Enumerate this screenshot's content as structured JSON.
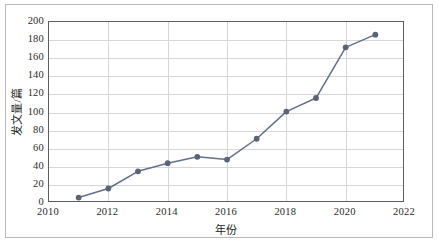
{
  "chart_data": {
    "type": "line",
    "title": "",
    "xlabel": "年份",
    "ylabel": "发文量/篇",
    "x": [
      2011,
      2012,
      2013,
      2014,
      2015,
      2016,
      2017,
      2018,
      2019,
      2020,
      2021
    ],
    "values": [
      6,
      16,
      35,
      44,
      51,
      48,
      71,
      101,
      116,
      172,
      186
    ],
    "series": [
      {
        "name": "发文量",
        "values": [
          6,
          16,
          35,
          44,
          51,
          48,
          71,
          101,
          116,
          172,
          186
        ]
      }
    ],
    "xlim": [
      2010,
      2022
    ],
    "ylim": [
      0,
      200
    ],
    "xticks": [
      2010,
      2012,
      2014,
      2016,
      2018,
      2020,
      2022
    ],
    "xtick_labels": [
      "2010",
      "2012",
      "2014",
      "2016",
      "2018",
      "2020",
      "2022"
    ],
    "yticks": [
      0,
      20,
      40,
      60,
      80,
      100,
      120,
      140,
      160,
      180,
      200
    ],
    "ytick_labels": [
      "0",
      "20",
      "40",
      "60",
      "80",
      "100",
      "120",
      "140",
      "160",
      "180",
      "200"
    ],
    "grid": {
      "horizontal": true,
      "vertical": true,
      "color": "#d6d6d6"
    },
    "legend": {
      "visible": false,
      "position": "none"
    },
    "marker": "circle",
    "colors": {
      "line": "#62708a",
      "marker": "#5a6478",
      "axis": "#5e5e5e",
      "grid": "#d6d6d6",
      "text": "#2b2b2b",
      "frame": "#b9b9b9",
      "background": "#ffffff"
    }
  }
}
